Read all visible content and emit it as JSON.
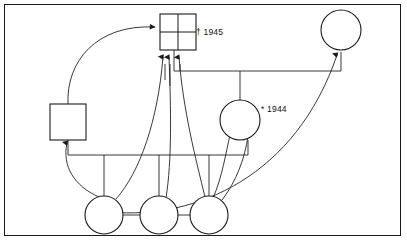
{
  "diagram": {
    "kind": "kinship-chart",
    "title": "",
    "frame": {
      "stroke": "#1a1a1a",
      "background": "#ffffff",
      "line_color": "#222222"
    },
    "annotations": [
      {
        "id": "death-1945",
        "text": "† 1945",
        "symbol": "dagger",
        "meaning": "died",
        "year": "1945",
        "attached_to": "ego-square-deceased"
      },
      {
        "id": "birth-1944",
        "text": "* 1944",
        "symbol": "asterisk",
        "meaning": "born",
        "year": "1944",
        "attached_to": "circle-center"
      }
    ],
    "nodes": [
      {
        "id": "ego-square-deceased",
        "shape": "square",
        "marked": "cross",
        "x": 178,
        "y": 28,
        "size": 36,
        "label": ""
      },
      {
        "id": "square-left",
        "shape": "square",
        "marked": "none",
        "x": 68,
        "y": 122,
        "size": 36,
        "label": ""
      },
      {
        "id": "circle-top-right",
        "shape": "circle",
        "x": 341,
        "y": 30,
        "size": 40,
        "label": ""
      },
      {
        "id": "circle-center",
        "shape": "circle",
        "x": 240,
        "y": 120,
        "size": 40,
        "label": ""
      },
      {
        "id": "circle-bottom-1",
        "shape": "circle",
        "x": 104,
        "y": 215,
        "size": 38,
        "label": ""
      },
      {
        "id": "circle-bottom-2",
        "shape": "circle",
        "x": 159,
        "y": 215,
        "size": 38,
        "label": ""
      },
      {
        "id": "circle-bottom-3",
        "shape": "circle",
        "x": 209,
        "y": 215,
        "size": 38,
        "label": ""
      }
    ],
    "edges": [
      {
        "id": "edge-sibling-bar",
        "type": "sibling-bar",
        "from": "square-left",
        "to": "circle-center"
      },
      {
        "id": "edge-marriage-bar-top",
        "type": "marriage-bar",
        "from": "ego-square-deceased",
        "to": "circle-top-right"
      },
      {
        "id": "edge-arrow-left-curve",
        "type": "arrow-curve",
        "from": "square-left",
        "to": "ego-square-deceased"
      },
      {
        "id": "edge-arrow-b1-ego",
        "type": "arrow-curve",
        "from": "circle-bottom-1",
        "to": "ego-square-deceased"
      },
      {
        "id": "edge-arrow-b2-ego",
        "type": "arrow-curve",
        "from": "circle-bottom-2",
        "to": "ego-square-deceased"
      },
      {
        "id": "edge-arrow-b3-ego",
        "type": "arrow-curve",
        "from": "circle-bottom-3",
        "to": "ego-square-deceased"
      },
      {
        "id": "edge-arrow-b3-center",
        "type": "arrow-curve",
        "from": "circle-bottom-3",
        "to": "circle-center"
      },
      {
        "id": "edge-arrow-b3b-center",
        "type": "arrow-curve",
        "from": "circle-bottom-3",
        "to": "circle-center"
      },
      {
        "id": "edge-arrow-b3-topright",
        "type": "arrow-curve",
        "from": "circle-bottom-3",
        "to": "circle-top-right"
      },
      {
        "id": "edge-arrow-b1-squareleft",
        "type": "arrow-curve",
        "from": "circle-bottom-1",
        "to": "square-left"
      },
      {
        "id": "edge-bottom-sibling-link",
        "type": "sibling-link",
        "from": "circle-bottom-1",
        "to": "circle-bottom-3"
      }
    ]
  }
}
